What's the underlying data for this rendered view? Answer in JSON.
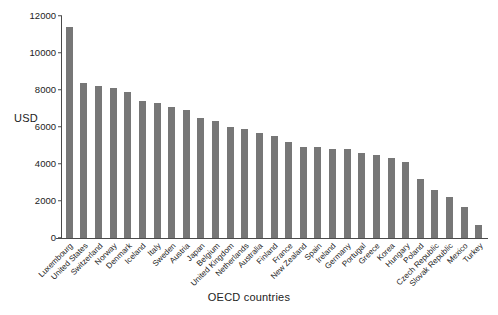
{
  "chart_data": {
    "type": "bar",
    "title": "",
    "xlabel": "OECD countries",
    "ylabel": "USD",
    "ylim": [
      0,
      12000
    ],
    "yticks": [
      0,
      2000,
      4000,
      6000,
      8000,
      10000,
      12000
    ],
    "ytick_labels": [
      "0",
      "2000",
      "4000",
      "6000",
      "8000",
      "10000",
      "12000"
    ],
    "grid": false,
    "legend": null,
    "bar_color": "#777777",
    "axis_color": "#4a4a4a",
    "categories": [
      "Luxembourg",
      "United States",
      "Switzerland",
      "Norway",
      "Denmark",
      "Iceland",
      "Italy",
      "Sweden",
      "Austria",
      "Japan",
      "Belgium",
      "United Kingdom",
      "Netherlands",
      "Australia",
      "Finland",
      "France",
      "New Zealand",
      "Spain",
      "Ireland",
      "Germany",
      "Portugal",
      "Greece",
      "Korea",
      "Hungary",
      "Poland",
      "Czech Republic",
      "Slovak Republic",
      "Mexico",
      "Turkey"
    ],
    "values": [
      11400,
      8400,
      8200,
      8100,
      7900,
      7400,
      7300,
      7100,
      6900,
      6500,
      6300,
      6000,
      5900,
      5700,
      5500,
      5200,
      4900,
      4900,
      4800,
      4800,
      4600,
      4500,
      4300,
      4100,
      3200,
      2600,
      2200,
      1700,
      700
    ]
  }
}
